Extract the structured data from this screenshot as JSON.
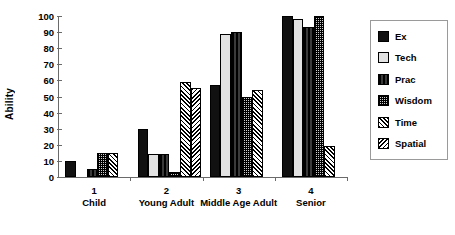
{
  "chart_data": {
    "type": "bar",
    "title": "",
    "xlabel": "",
    "ylabel": "Ability",
    "ylim": [
      0,
      100
    ],
    "yticks": [
      0,
      10,
      20,
      30,
      40,
      50,
      60,
      70,
      80,
      90,
      100
    ],
    "grid": false,
    "legend_position": "right",
    "categories": [
      "Child",
      "Young Adult",
      "Middle Age Adult",
      "Senior"
    ],
    "category_numbers": [
      "1",
      "2",
      "3",
      "4"
    ],
    "series": [
      {
        "name": "Ex",
        "values": [
          10,
          30,
          57,
          100
        ]
      },
      {
        "name": "Tech",
        "values": [
          0,
          14,
          89,
          98
        ]
      },
      {
        "name": "Prac",
        "values": [
          5,
          14,
          90,
          93
        ]
      },
      {
        "name": "Wisdom",
        "values": [
          15,
          3,
          50,
          100
        ]
      },
      {
        "name": "Time",
        "values": [
          15,
          59,
          54,
          19
        ]
      },
      {
        "name": "Spatial",
        "values": [
          0,
          55,
          0,
          0
        ]
      }
    ]
  },
  "axis": {
    "y_title": "Ability",
    "y_tick_labels": [
      "100",
      "90",
      "80",
      "70",
      "60",
      "50",
      "40",
      "30",
      "20",
      "10",
      "0"
    ],
    "x_tick_numbers": [
      "1",
      "2",
      "3",
      "4"
    ],
    "x_tick_names": [
      "Child",
      "Young Adult",
      "Middle Age Adult",
      "Senior"
    ]
  },
  "legend": {
    "items": [
      {
        "label": "Ex",
        "pattern": "solid-black",
        "color": "#111111"
      },
      {
        "label": "Tech",
        "pattern": "solid-light-gray",
        "color": "#e2e2e2"
      },
      {
        "label": "Prac",
        "pattern": "vertical-lines",
        "color": "#1a1a1a"
      },
      {
        "label": "Wisdom",
        "pattern": "checker-dots",
        "color": "#2b2b2b"
      },
      {
        "label": "Time",
        "pattern": "diagonal-up-hatch",
        "color": "#000000"
      },
      {
        "label": "Spatial",
        "pattern": "diagonal-down-hatch",
        "color": "#000000"
      }
    ]
  }
}
